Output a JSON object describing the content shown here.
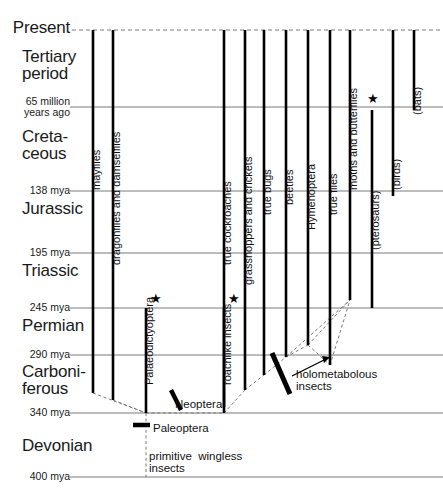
{
  "figure": {
    "type": "timeline-diagram",
    "width": 443,
    "height": 500,
    "line_color": "#000000",
    "grid_color": "#6b6b6b",
    "dashed_color": "#7a7a7a"
  },
  "time_axis": {
    "unit": "mya",
    "rows": [
      {
        "label": "Present",
        "y": 30,
        "style": "dashed"
      },
      {
        "label": "65 million\nyears ago",
        "y": 107,
        "style": "solid"
      },
      {
        "label": "138 mya",
        "y": 191,
        "style": "solid"
      },
      {
        "label": "195 mya",
        "y": 253,
        "style": "solid"
      },
      {
        "label": "245 mya",
        "y": 308,
        "style": "solid"
      },
      {
        "label": "290 mya",
        "y": 355,
        "style": "solid"
      },
      {
        "label": "340 mya",
        "y": 413,
        "style": "solid"
      },
      {
        "label": "400 mya",
        "y": 477,
        "style": "solid"
      }
    ]
  },
  "periods": [
    {
      "name": "Tertiary\nperiod",
      "y": 48,
      "size": "big"
    },
    {
      "name": "Creta-\nceous",
      "y": 128,
      "size": "big"
    },
    {
      "name": "Jurassic",
      "y": 200,
      "size": "big"
    },
    {
      "name": "Triassic",
      "y": 262,
      "size": "big"
    },
    {
      "name": "Permian",
      "y": 317,
      "size": "big"
    },
    {
      "name": "Carboni-\nferous",
      "y": 363,
      "size": "big"
    },
    {
      "name": "Devonian",
      "y": 437,
      "size": "big"
    }
  ],
  "lineages": [
    {
      "name": "mayflies",
      "x": 93,
      "top": 30,
      "bottom": 393,
      "extinct": false,
      "dashed": false
    },
    {
      "name": "dragonflies and damselflies",
      "x": 113,
      "top": 30,
      "bottom": 400,
      "extinct": false,
      "dashed": false
    },
    {
      "name": "Palaeodictyoptera",
      "x": 146,
      "top": 308,
      "bottom": 413,
      "extinct": true,
      "dashed": false
    },
    {
      "name": "true cockroaches",
      "x": 224,
      "top": 30,
      "bottom": 407,
      "extinct": false,
      "dashed": false
    },
    {
      "name": "roachlike insects",
      "x": 224,
      "top": 308,
      "bottom": 413,
      "extinct": true,
      "dashed": false
    },
    {
      "name": "grasshoppers and crickets",
      "x": 245,
      "top": 30,
      "bottom": 390,
      "extinct": false,
      "dashed": false
    },
    {
      "name": "true bugs",
      "x": 264,
      "top": 30,
      "bottom": 375,
      "extinct": false,
      "dashed": false
    },
    {
      "name": "beetles",
      "x": 286,
      "top": 30,
      "bottom": 357,
      "extinct": false,
      "dashed": false
    },
    {
      "name": "Hymenoptera",
      "x": 308,
      "top": 30,
      "bottom": 345,
      "extinct": false,
      "dashed": false
    },
    {
      "name": "true flies",
      "x": 330,
      "top": 30,
      "bottom": 365,
      "extinct": false,
      "dashed": false
    },
    {
      "name": "moths and butterflies",
      "x": 350,
      "top": 30,
      "bottom": 300,
      "extinct": false,
      "dashed": false
    },
    {
      "name": "(pterosaurs)",
      "x": 372,
      "top": 110,
      "bottom": 308,
      "extinct": true,
      "dashed": false
    },
    {
      "name": "(birds)",
      "x": 393,
      "top": 30,
      "bottom": 196,
      "extinct": false,
      "dashed": false
    },
    {
      "name": "(bats)",
      "x": 414,
      "top": 30,
      "bottom": 110,
      "extinct": false,
      "dashed": false
    }
  ],
  "vertical_labels": [
    {
      "text": "mayflies",
      "x": 90,
      "y": 190
    },
    {
      "text": "dragonflies and damselflies",
      "x": 110,
      "y": 265
    },
    {
      "text": "Palaeodictyoptera",
      "x": 143,
      "y": 385
    },
    {
      "text": "true cockroaches",
      "x": 221,
      "y": 265
    },
    {
      "text": "roachlike insects",
      "x": 221,
      "y": 385
    },
    {
      "text": "grasshoppers and crickets",
      "x": 242,
      "y": 285
    },
    {
      "text": "true bugs",
      "x": 261,
      "y": 215
    },
    {
      "text": "beetles",
      "x": 283,
      "y": 205
    },
    {
      "text": "Hymenoptera",
      "x": 305,
      "y": 230
    },
    {
      "text": "true flies",
      "x": 327,
      "y": 215
    },
    {
      "text": "moths and butterflies",
      "x": 347,
      "y": 190
    },
    {
      "text": "(pterosaurs)",
      "x": 369,
      "y": 250
    },
    {
      "text": "(birds)",
      "x": 390,
      "y": 190
    },
    {
      "text": "(bats)",
      "x": 411,
      "y": 115
    }
  ],
  "annotations": [
    {
      "name": "neoptera",
      "text": "Neoptera",
      "x": 175,
      "y": 398
    },
    {
      "name": "holometabolous",
      "text": "holometabolous\ninsects",
      "x": 296,
      "y": 368
    },
    {
      "name": "paleoptera",
      "text": "Paleoptera",
      "x": 153,
      "y": 422
    },
    {
      "name": "primitive-wingless",
      "text": "primitive  wingless\ninsects",
      "x": 149,
      "y": 450
    }
  ],
  "extinction_markers": [
    {
      "name": "palaeodictyoptera-extinction",
      "x": 150,
      "y": 292
    },
    {
      "name": "roachlike-extinction",
      "x": 228,
      "y": 292
    },
    {
      "name": "pterosaur-extinction",
      "x": 367,
      "y": 92
    }
  ],
  "tick_marks": {
    "neoptera_bar": {
      "x1": 171,
      "y1": 390,
      "x2": 181,
      "y2": 410
    },
    "holometabolous_bar": {
      "x1": 272,
      "y1": 353,
      "x2": 290,
      "y2": 394
    },
    "paleoptera_bar": {
      "x1": 133,
      "y1": 425,
      "x2": 150,
      "y2": 425
    }
  }
}
